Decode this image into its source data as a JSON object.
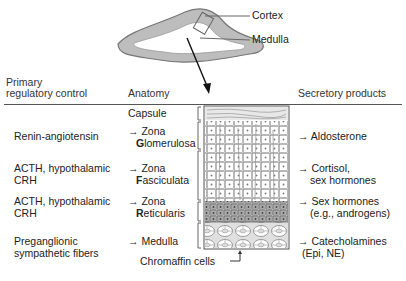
{
  "gland_labels": {
    "cortex": "Cortex",
    "medulla": "Medulla"
  },
  "headers": {
    "regulatory_line1": "Primary",
    "regulatory_line2": "regulatory control",
    "anatomy": "Anatomy",
    "products": "Secretory products"
  },
  "capsule_label": "Capsule",
  "rows": [
    {
      "control": [
        "Renin-angiotensin"
      ],
      "anatomy_arrow": "→ Zona",
      "anatomy_initial": "G",
      "anatomy_rest": "lomerulosa",
      "products": [
        "→ Aldosterone"
      ]
    },
    {
      "control": [
        "ACTH, hypothalamic",
        "CRH"
      ],
      "anatomy_arrow": "→ Zona",
      "anatomy_initial": "F",
      "anatomy_rest": "asciculata",
      "products": [
        "→ Cortisol,",
        "sex hormones"
      ]
    },
    {
      "control": [
        "ACTH, hypothalamic",
        "CRH"
      ],
      "anatomy_arrow": "→ Zona",
      "anatomy_initial": "R",
      "anatomy_rest": "eticularis",
      "products": [
        "→ Sex hormones",
        "(e.g., androgens)"
      ]
    },
    {
      "control": [
        "Preganglionic",
        "sympathetic fibers"
      ],
      "anatomy_arrow": "→ Medulla",
      "products": [
        "→ Catecholamines",
        "(Epi, NE)"
      ]
    }
  ],
  "chromaffin_label": "Chromaffin cells"
}
